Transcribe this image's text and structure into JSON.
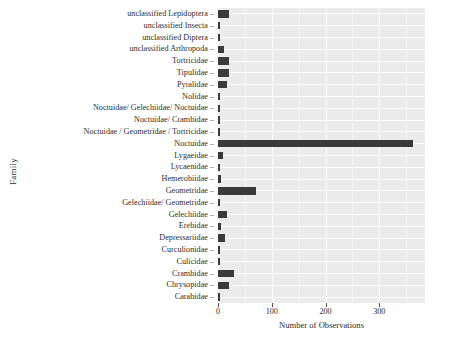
{
  "chart_data": {
    "type": "bar",
    "orientation": "horizontal",
    "title": "",
    "xlabel": "Number of Observations",
    "ylabel": "Family",
    "xlim": [
      0,
      385
    ],
    "ylim": null,
    "grid": true,
    "legend": false,
    "legend_position": "none",
    "bar_color": "#3a3a3a",
    "panel_background": "#ebebeb",
    "gridline_color": "#ffffff",
    "xticks": [
      0,
      100,
      200,
      300
    ],
    "xtick_labels": [
      "0",
      "100",
      "200",
      "300"
    ],
    "categories": [
      "unclassified Lepidoptera",
      "unclassified Insecta",
      "unclassified Diptera",
      "unclassified Arthropoda",
      "Tortricidae",
      "Tipulidae",
      "Pyralidae",
      "Nolidae",
      "Noctuidae/ Gelechiidae/ Noctuidae",
      "Noctuidae/ Crambidae",
      "Noctuidae / Geometridae / Tortricidae",
      "Noctuidae",
      "Lygaeidae",
      "Lycaenidae",
      "Hemerobiidae",
      "Geometridae",
      "Gelechiidae/ Geometridae",
      "Gelechiidae",
      "Erebidae",
      "Depressariidae",
      "Curculionidae",
      "Culicidae",
      "Crambidae",
      "Chrysopidae",
      "Carabidae"
    ],
    "values": [
      21,
      3,
      3,
      11,
      20,
      20,
      17,
      2,
      2,
      2,
      2,
      363,
      9,
      2,
      5,
      71,
      2,
      16,
      5,
      13,
      2,
      2,
      30,
      20,
      2
    ]
  },
  "axis": {
    "y_title": "Family",
    "x_title": "Number of Observations",
    "tick_dash": "–"
  }
}
